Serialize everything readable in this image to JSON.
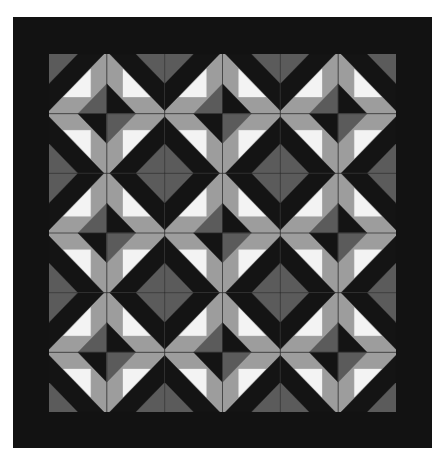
{
  "quilt": {
    "blocks_x": 6,
    "blocks_y": 6,
    "colors": {
      "border": "#121212",
      "black": "#141414",
      "dark_gray": "#5b5b5b",
      "light_gray": "#9d9d9d",
      "white": "#f3f3f3",
      "seam": "#2a2a2a"
    }
  }
}
